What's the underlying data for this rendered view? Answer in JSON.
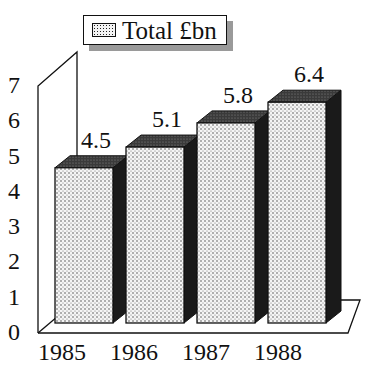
{
  "chart_data": {
    "type": "bar",
    "title": "",
    "xlabel": "",
    "ylabel": "",
    "categories": [
      "1985",
      "1986",
      "1987",
      "1988"
    ],
    "series": [
      {
        "name": "Total £bn",
        "values": [
          4.5,
          5.1,
          5.8,
          6.4
        ]
      }
    ],
    "data_labels": [
      "4.5",
      "5.1",
      "5.8",
      "6.4"
    ],
    "ylim": [
      0,
      7
    ],
    "yticks": [
      "0",
      "1",
      "2",
      "3",
      "4",
      "5",
      "6",
      "7"
    ],
    "grid": false,
    "legend_position": "top",
    "style": "3d-bar, dotted fill, dark sides"
  },
  "legend": {
    "label": "Total £bn"
  },
  "colors": {
    "bar_front": "#f2f2f2",
    "bar_top": "#444444",
    "bar_side": "#1a1a1a",
    "axis": "#111111",
    "legend_shadow": "#9a9a9a"
  }
}
